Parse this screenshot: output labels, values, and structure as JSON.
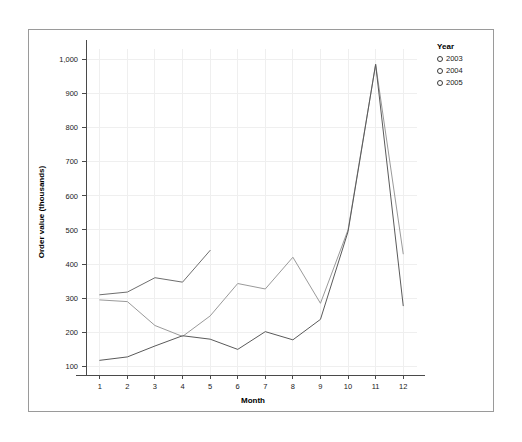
{
  "figure": {
    "background_color": "#ffffff",
    "frame_color": "#9a9a9a"
  },
  "legend": {
    "title": "Year",
    "marker_icon": "circle-outline-icon",
    "position": "top-right",
    "entries": [
      {
        "label": "2003",
        "color": "#6e6e6e"
      },
      {
        "label": "2004",
        "color": "#9a9a9a"
      },
      {
        "label": "2005",
        "color": "#5a5a5a"
      }
    ]
  },
  "chart_data": {
    "type": "line",
    "title": "",
    "subtitle": "",
    "xlabel": "Month",
    "ylabel": "Order value (thousands)",
    "categories": [
      1,
      2,
      3,
      4,
      5,
      6,
      7,
      8,
      9,
      10,
      11,
      12
    ],
    "x_tick_labels": [
      "1",
      "2",
      "3",
      "4",
      "5",
      "6",
      "7",
      "8",
      "9",
      "10",
      "11",
      "12"
    ],
    "y_tick_labels": [
      "100",
      "200",
      "300",
      "400",
      "500",
      "600",
      "700",
      "800",
      "900",
      "1,000"
    ],
    "y_ticks": [
      100,
      200,
      300,
      400,
      500,
      600,
      700,
      800,
      900,
      1000
    ],
    "xlim": [
      0.5,
      12.5
    ],
    "ylim": [
      75,
      1030
    ],
    "grid": true,
    "legend_position": "top-right",
    "series": [
      {
        "name": "2003",
        "color": "#6e6e6e",
        "x": [
          1,
          2,
          3,
          4,
          5
        ],
        "values": [
          310,
          318,
          360,
          347,
          440
        ]
      },
      {
        "name": "2004",
        "color": "#9a9a9a",
        "x": [
          1,
          2,
          3,
          4,
          5,
          6,
          7,
          8,
          9,
          10,
          11,
          12
        ],
        "values": [
          295,
          290,
          220,
          188,
          248,
          343,
          327,
          420,
          285,
          500,
          985,
          430
        ]
      },
      {
        "name": "2005",
        "color": "#5a5a5a",
        "x": [
          1,
          2,
          3,
          4,
          5,
          6,
          7,
          8,
          9,
          10,
          11,
          12
        ],
        "values": [
          118,
          128,
          160,
          190,
          180,
          150,
          202,
          178,
          238,
          495,
          985,
          278
        ]
      }
    ]
  }
}
